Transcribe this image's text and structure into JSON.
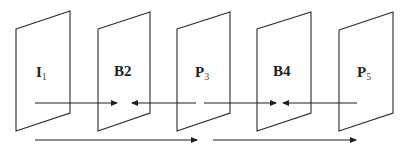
{
  "diagram": {
    "type": "frame-prediction-structure",
    "frames": [
      {
        "id": "I1",
        "main": "I",
        "sub": "1",
        "x": 16
      },
      {
        "id": "B2",
        "main": "B2",
        "sub": "",
        "x": 98
      },
      {
        "id": "P3",
        "main": "P",
        "sub": "3",
        "x": 177
      },
      {
        "id": "B4",
        "main": "B4",
        "sub": "",
        "x": 257
      },
      {
        "id": "P5",
        "main": "P",
        "sub": "5",
        "x": 339
      }
    ],
    "arrows": [
      {
        "from": "I1",
        "to": "B2",
        "row": 1
      },
      {
        "from": "P3",
        "to": "B2",
        "row": 1
      },
      {
        "from": "P3",
        "to": "B4",
        "row": 1
      },
      {
        "from": "P5",
        "to": "B4",
        "row": 1
      },
      {
        "from": "I1",
        "to": "P3",
        "row": 2
      },
      {
        "from": "P3",
        "to": "P5",
        "row": 2
      }
    ],
    "colors": {
      "stroke": "#2a2a2a",
      "background": "#ffffff"
    }
  }
}
